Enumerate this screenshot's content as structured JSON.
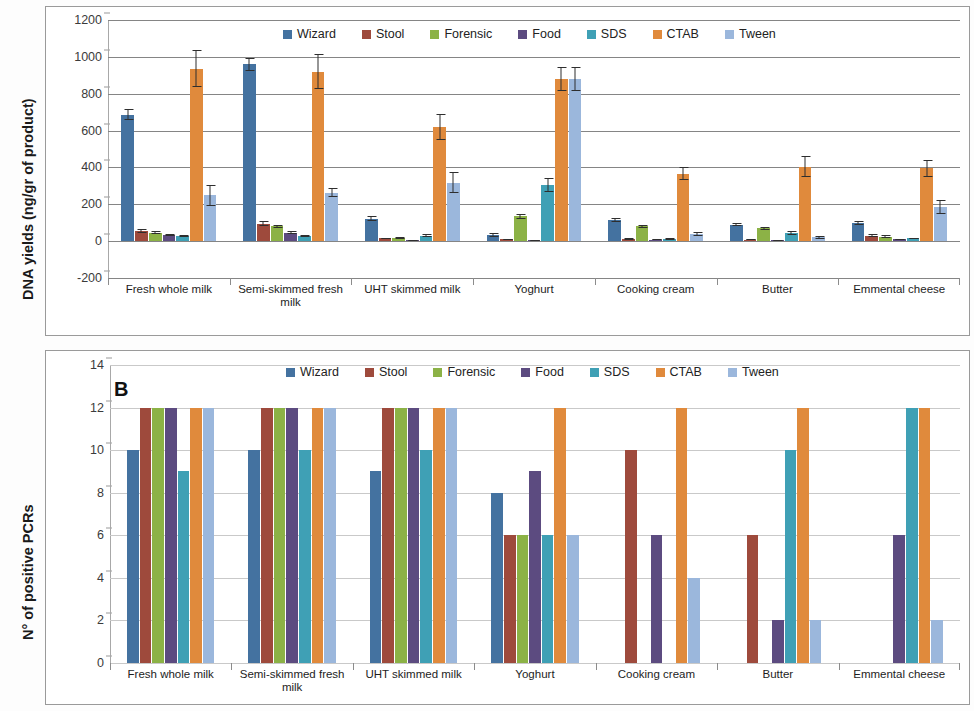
{
  "figure": {
    "panel_b_letter": "B"
  },
  "series_colors": {
    "Wizard": "#4472A0",
    "Stool": "#9E4A3C",
    "Forensic": "#8CB246",
    "Food": "#5C4B80",
    "SDS": "#3FA0B5",
    "CTAB": "#E08A3C",
    "Tween": "#9BB7DC"
  },
  "chart_data": [
    {
      "id": "panel-a",
      "type": "bar",
      "title": "",
      "xlabel": "",
      "ylabel": "DNA yields (ng/gr of product)",
      "ylim": [
        -200,
        1200
      ],
      "ytick_step": 200,
      "yticks": [
        1200,
        1000,
        800,
        600,
        400,
        200,
        0,
        -200
      ],
      "grid": true,
      "legend_position": "top-center",
      "categories": [
        "Fresh whole milk",
        "Semi-skimmed fresh milk",
        "UHT skimmed milk",
        "Yoghurt",
        "Cooking cream",
        "Butter",
        "Emmental cheese"
      ],
      "series": [
        {
          "name": "Wizard",
          "values": [
            685,
            960,
            122,
            35,
            115,
            90,
            98
          ],
          "errors": [
            30,
            35,
            15,
            10,
            12,
            10,
            12
          ]
        },
        {
          "name": "Stool",
          "values": [
            55,
            95,
            15,
            10,
            12,
            8,
            30
          ],
          "errors": [
            10,
            12,
            5,
            4,
            5,
            4,
            8
          ]
        },
        {
          "name": "Forensic",
          "values": [
            45,
            80,
            18,
            135,
            80,
            70,
            25
          ],
          "errors": [
            8,
            10,
            5,
            12,
            8,
            8,
            6
          ]
        },
        {
          "name": "Food",
          "values": [
            35,
            45,
            5,
            5,
            8,
            5,
            10
          ],
          "errors": [
            6,
            8,
            3,
            3,
            3,
            3,
            4
          ]
        },
        {
          "name": "SDS",
          "values": [
            28,
            30,
            30,
            305,
            12,
            45,
            15
          ],
          "errors": [
            5,
            6,
            8,
            40,
            4,
            10,
            5
          ]
        },
        {
          "name": "CTAB",
          "values": [
            935,
            920,
            620,
            880,
            365,
            405,
            395
          ],
          "errors": [
            100,
            95,
            70,
            65,
            35,
            55,
            45
          ]
        },
        {
          "name": "Tween",
          "values": [
            248,
            262,
            318,
            880,
            40,
            20,
            185
          ],
          "errors": [
            55,
            25,
            55,
            65,
            12,
            8,
            40
          ]
        }
      ]
    },
    {
      "id": "panel-b",
      "type": "bar",
      "title": "B",
      "xlabel": "",
      "ylabel": "N° of positive PCRs",
      "ylim": [
        0,
        14
      ],
      "ytick_step": 2,
      "yticks": [
        14,
        12,
        10,
        8,
        6,
        4,
        2,
        0
      ],
      "grid": true,
      "legend_position": "top-center",
      "categories": [
        "Fresh whole milk",
        "Semi-skimmed fresh milk",
        "UHT skimmed milk",
        "Yoghurt",
        "Cooking cream",
        "Butter",
        "Emmental cheese"
      ],
      "series": [
        {
          "name": "Wizard",
          "values": [
            10,
            10,
            9,
            8,
            0,
            0,
            0
          ]
        },
        {
          "name": "Stool",
          "values": [
            12,
            12,
            12,
            6,
            10,
            6,
            0
          ]
        },
        {
          "name": "Forensic",
          "values": [
            12,
            12,
            12,
            6,
            0,
            0,
            0
          ]
        },
        {
          "name": "Food",
          "values": [
            12,
            12,
            12,
            9,
            6,
            2,
            6
          ]
        },
        {
          "name": "SDS",
          "values": [
            9,
            10,
            10,
            6,
            0,
            10,
            12
          ]
        },
        {
          "name": "CTAB",
          "values": [
            12,
            12,
            12,
            12,
            12,
            12,
            12
          ]
        },
        {
          "name": "Tween",
          "values": [
            12,
            12,
            12,
            6,
            4,
            2,
            2
          ]
        }
      ]
    }
  ],
  "legend": {
    "items": [
      {
        "label": "Wizard"
      },
      {
        "label": "Stool"
      },
      {
        "label": "Forensic"
      },
      {
        "label": "Food"
      },
      {
        "label": "SDS"
      },
      {
        "label": "CTAB"
      },
      {
        "label": "Tween"
      }
    ]
  }
}
